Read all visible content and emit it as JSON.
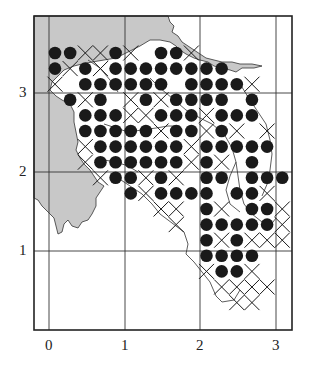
{
  "chart_data": {
    "type": "scatter",
    "title": "",
    "xlabel": "",
    "ylabel": "",
    "x_ticks": [
      "0",
      "1",
      "2",
      "3"
    ],
    "y_ticks": [
      "1",
      "2",
      "3"
    ],
    "grid": true,
    "legend": [],
    "symbols": {
      "dot": "filled circle",
      "cross": "x mark"
    },
    "grid_origin": {
      "x0": 0.08,
      "y0": 3.48
    },
    "grid_step": 0.2,
    "rows": [
      {
        "dots": [
          0,
          1,
          4,
          7,
          8
        ],
        "crosses": [
          2,
          3,
          5,
          9
        ]
      },
      {
        "dots": [
          0,
          2,
          4,
          5,
          6,
          7,
          8,
          9,
          10,
          11
        ],
        "crosses": [
          1,
          3
        ]
      },
      {
        "dots": [
          2,
          3,
          4,
          5,
          6,
          7,
          9,
          10,
          11,
          12
        ],
        "crosses": [
          0,
          13
        ]
      },
      {
        "dots": [
          1,
          3,
          6,
          8,
          9,
          10,
          11,
          13
        ],
        "crosses": [
          2,
          5,
          7
        ]
      },
      {
        "dots": [
          2,
          3,
          4,
          7,
          8,
          9,
          11,
          12,
          13
        ],
        "crosses": [
          5,
          6,
          10
        ]
      },
      {
        "dots": [
          2,
          3,
          4,
          5,
          6,
          8,
          9,
          11
        ],
        "crosses": [
          7,
          10,
          12,
          14
        ]
      },
      {
        "dots": [
          3,
          4,
          5,
          6,
          7,
          8,
          10,
          11,
          12,
          13,
          14
        ],
        "crosses": [
          2,
          9
        ]
      },
      {
        "dots": [
          3,
          4,
          5,
          6,
          7,
          8,
          10,
          13
        ],
        "crosses": [
          2,
          9,
          11
        ]
      },
      {
        "dots": [
          4,
          5,
          7,
          10,
          11,
          13,
          14,
          15
        ],
        "crosses": [
          3,
          6,
          8
        ]
      },
      {
        "dots": [
          5,
          7,
          8,
          9,
          10,
          12,
          13
        ],
        "crosses": [
          6,
          14
        ]
      },
      {
        "dots": [
          10,
          13,
          14
        ],
        "crosses": [
          7,
          8,
          11,
          15
        ]
      },
      {
        "dots": [
          10,
          11,
          12,
          13,
          14
        ],
        "crosses": [
          8,
          15
        ]
      },
      {
        "dots": [
          10,
          12
        ],
        "crosses": [
          11,
          13,
          14,
          15
        ]
      },
      {
        "dots": [
          10,
          11,
          12,
          13
        ],
        "crosses": []
      },
      {
        "dots": [
          11,
          12
        ],
        "crosses": [
          10,
          13
        ]
      },
      {
        "dots": [],
        "crosses": [
          11,
          12,
          13,
          14
        ]
      },
      {
        "dots": [],
        "crosses": [
          12,
          13
        ]
      }
    ]
  },
  "axes": {
    "x_labels": [
      {
        "text": "0",
        "x": 49
      },
      {
        "text": "1",
        "x": 125
      },
      {
        "text": "2",
        "x": 200
      },
      {
        "text": "3",
        "x": 276
      }
    ],
    "y_labels": [
      {
        "text": "3",
        "y": 93
      },
      {
        "text": "2",
        "y": 172
      },
      {
        "text": "1",
        "y": 251
      }
    ]
  },
  "colors": {
    "land": "#c8c8c8",
    "ink": "#1a1a1a",
    "grid": "#333333",
    "background": "#ffffff"
  },
  "layout": {
    "frame": {
      "left": 34,
      "top": 16,
      "right": 292,
      "bottom": 330
    },
    "col0_px": 55,
    "col_step_px": 15.15,
    "row0_px": 53,
    "row_step_px": 15.6,
    "dot_radius": 6.3,
    "cross_half": 7.5
  }
}
